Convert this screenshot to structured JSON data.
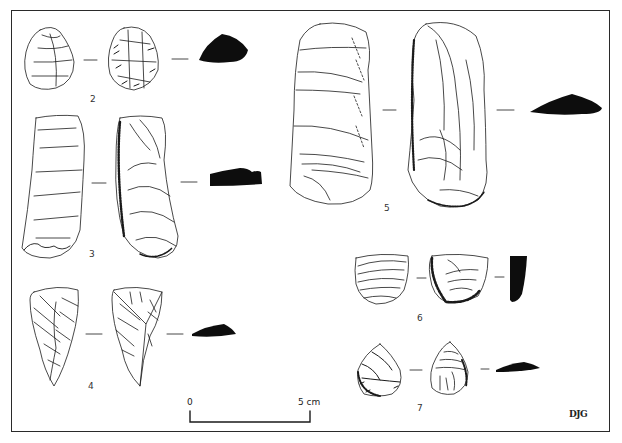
{
  "figure": {
    "artifacts": [
      {
        "id": "2",
        "label": "2",
        "views": [
          "dorsal",
          "ventral",
          "section"
        ]
      },
      {
        "id": "3",
        "label": "3",
        "views": [
          "dorsal",
          "ventral",
          "section"
        ]
      },
      {
        "id": "4",
        "label": "4",
        "views": [
          "dorsal",
          "ventral",
          "section"
        ]
      },
      {
        "id": "5",
        "label": "5",
        "views": [
          "dorsal",
          "ventral",
          "section"
        ]
      },
      {
        "id": "6",
        "label": "6",
        "views": [
          "dorsal",
          "ventral",
          "section"
        ]
      },
      {
        "id": "7",
        "label": "7",
        "views": [
          "dorsal",
          "ventral",
          "section"
        ]
      }
    ],
    "scale_bar": {
      "start_label": "0",
      "end_label": "5 cm"
    },
    "signature": "DJG",
    "colors": {
      "ink": "#1a1a1a",
      "section_fill": "#0d0d0d",
      "frame": "#2a2a2a",
      "background": "#ffffff"
    }
  }
}
